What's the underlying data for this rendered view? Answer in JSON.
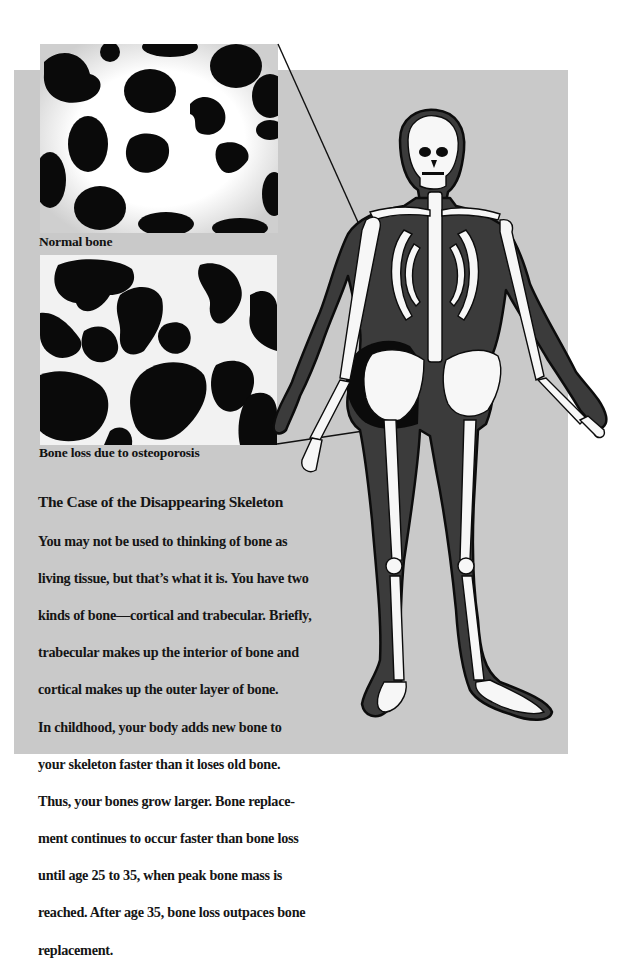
{
  "colors": {
    "panel_bg": "#c9c9c9",
    "body_fill": "#3b3b3b",
    "bone_fill": "#f7f7f7",
    "text": "#151515"
  },
  "images": {
    "normal": {
      "caption": "Normal bone",
      "icon": "trabecular-normal-bone-image"
    },
    "osteoporosis": {
      "caption": "Bone loss due to osteoporosis",
      "icon": "trabecular-osteoporosis-bone-image"
    }
  },
  "illustration": {
    "icon": "skeleton-figure-illustration"
  },
  "article": {
    "title": "The Case of the Disappearing Skeleton",
    "body_lines": [
      "You may not be used to thinking of bone as",
      "living tissue, but that’s what it is. You have two",
      "kinds of bone—cortical and trabecular. Briefly,",
      "trabecular makes up the interior of bone and",
      "cortical makes up the outer layer of bone.",
      "In childhood, your body adds new bone to",
      "your skeleton faster than it loses old bone.",
      "Thus, your bones grow larger. Bone replace-",
      "ment continues to occur faster than bone loss",
      "until age 25 to 35, when peak bone mass is",
      "reached. After age 35, bone loss outpaces bone",
      "replacement."
    ]
  }
}
